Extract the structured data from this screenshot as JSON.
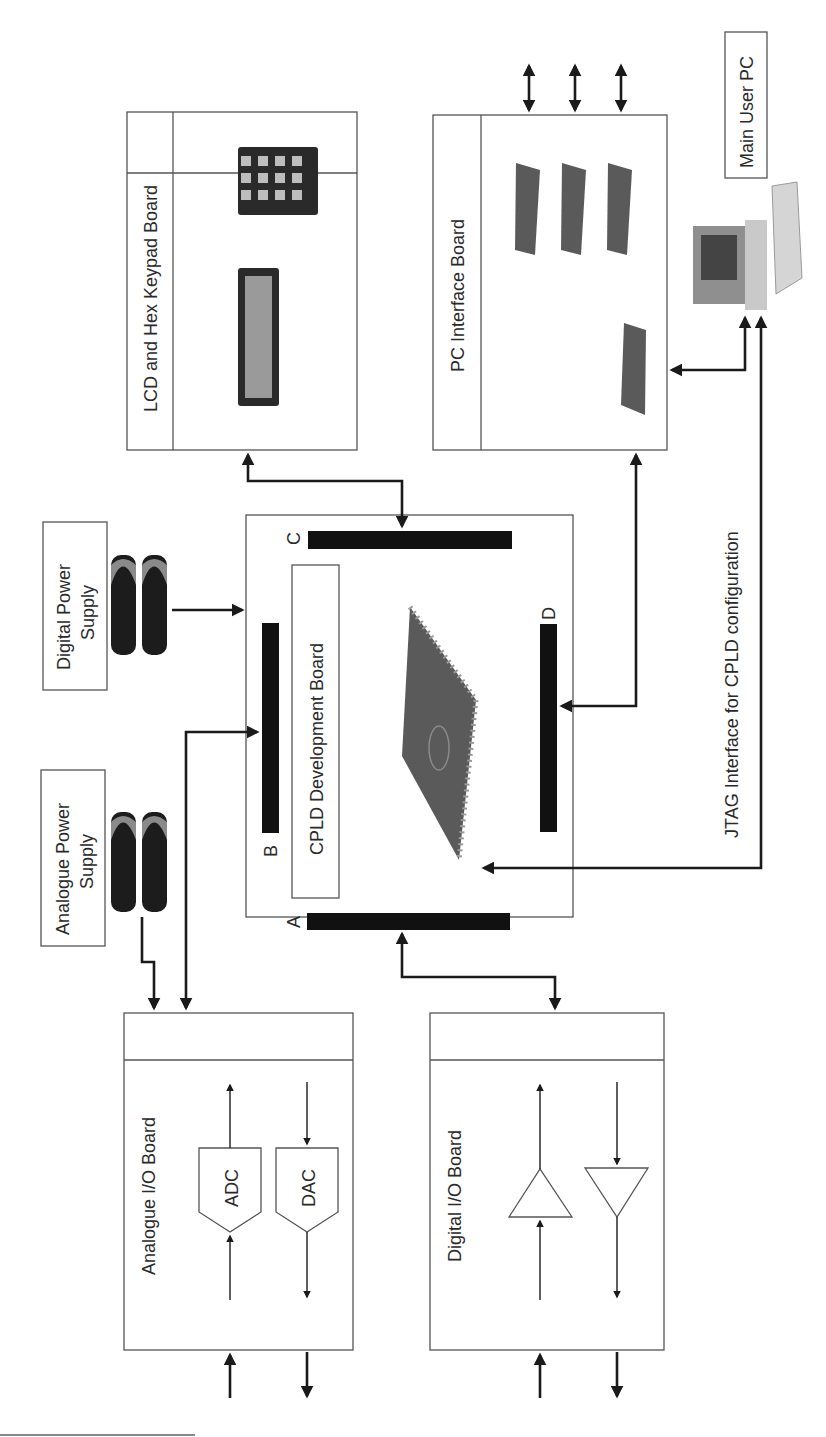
{
  "diagram": {
    "orientation": "rotated -90deg (text reads bottom-to-top)",
    "boards": {
      "analogue_io": {
        "title": "Analogue I/O Board",
        "blocks": [
          "ADC",
          "DAC"
        ]
      },
      "digital_io": {
        "title": "Digital I/O Board",
        "blocks": [
          "input buffer",
          "output buffer"
        ]
      },
      "cpld": {
        "title": "CPLD Development Board",
        "connectors": [
          "A",
          "B",
          "C",
          "D"
        ]
      },
      "lcd_keypad": {
        "title": "LCD and Hex Keypad Board"
      },
      "pc_interface": {
        "title": "PC Interface Board"
      }
    },
    "power": {
      "analogue": {
        "line1": "Analogue Power",
        "line2": "Supply"
      },
      "digital": {
        "line1": "Digital Power",
        "line2": "Supply"
      }
    },
    "pc": {
      "title": "Main User PC"
    },
    "jtag_label": "JTAG Interface for CPLD configuration",
    "labels": {
      "adc": "ADC",
      "dac": "DAC",
      "conn_a": "A",
      "conn_b": "B",
      "conn_c": "C",
      "conn_d": "D"
    },
    "colors": {
      "line": "#1a1a1a",
      "box_stroke": "#555555",
      "connector": "#111111",
      "chip": "#5a5a5a",
      "background": "#ffffff"
    }
  }
}
